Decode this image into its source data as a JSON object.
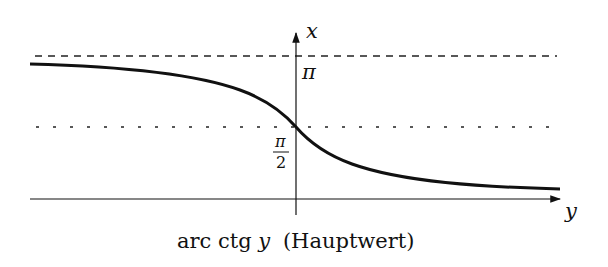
{
  "diagram": {
    "title": "arc ctg y (Hauptwert)",
    "caption_func": "arc ctg",
    "caption_var": "y",
    "caption_note": "(Hauptwert)",
    "axes": {
      "horizontal_label": "y",
      "vertical_label": "x"
    },
    "asymptotes": [
      {
        "value": "π",
        "style": "dashed"
      },
      {
        "value": "π/2",
        "style": "dotted"
      }
    ],
    "tick_labels": {
      "pi": "π",
      "half_pi_num": "π",
      "half_pi_den": "2"
    },
    "curve": {
      "function": "arccot(y)",
      "range": "(0, π)",
      "value_at_zero": "π/2"
    },
    "colors": {
      "stroke": "#111111",
      "background": "#ffffff"
    }
  }
}
